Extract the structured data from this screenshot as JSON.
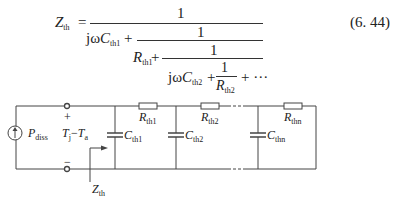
{
  "equation": {
    "lhs_symbol": "Z",
    "lhs_sub": "th",
    "equals": "=",
    "one": "1",
    "term_jwc": "jω",
    "c_symbol": "C",
    "c1_sub": "th1",
    "c2_sub": "th2",
    "plus": "+",
    "r_symbol": "R",
    "r1_sub": "th1",
    "r2_sub": "th2",
    "ellipsis": "+ ···",
    "number": "(6. 44)"
  },
  "circuit": {
    "source_label": "P",
    "source_sub": "diss",
    "plus_terminal": "+",
    "minus_terminal": "−",
    "voltage_label_a": "T",
    "voltage_sub_a": "j",
    "voltage_dash": "−",
    "voltage_label_b": "T",
    "voltage_sub_b": "a",
    "impedance_label": "Z",
    "impedance_sub": "th",
    "capacitors": [
      {
        "symbol": "C",
        "sub": "th1"
      },
      {
        "symbol": "C",
        "sub": "th2"
      },
      {
        "symbol": "C",
        "sub": "thn"
      }
    ],
    "resistors": [
      {
        "symbol": "R",
        "sub": "th1"
      },
      {
        "symbol": "R",
        "sub": "th2"
      },
      {
        "symbol": "R",
        "sub": "thn"
      }
    ]
  }
}
